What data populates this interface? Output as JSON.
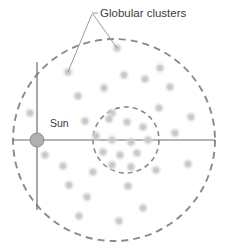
{
  "figure": {
    "type": "astronomy-diagram",
    "background_color": "#ffffff"
  },
  "labels": {
    "globular_clusters": "Globular clusters",
    "sun": "Sun"
  },
  "colors": {
    "dashed_circle": "#8a8a8a",
    "axis_line": "#6e6e6e",
    "leader_line": "#9a9a9a",
    "sun_fill": "#b0b0b0",
    "sun_stroke": "#8a8a8a",
    "cluster_dot": "#c9c9c9",
    "text": "#3a3a3a"
  },
  "halo_circle": {
    "name": "outer-halo-boundary",
    "cx": 114,
    "cy": 140,
    "r": 101,
    "style": "dashed",
    "dash": "7,5",
    "stroke_width": 1.9
  },
  "inner_circle": {
    "name": "galactic-center-region",
    "cx": 126,
    "cy": 140,
    "r": 33,
    "style": "dashed",
    "dash": "5,4",
    "stroke_width": 1.6
  },
  "sun_marker": {
    "cx": 37,
    "cy": 140,
    "r": 7,
    "label_x": 50,
    "label_y": 127
  },
  "axes": {
    "horizontal": {
      "x1": 13,
      "y1": 140,
      "x2": 215,
      "y2": 140
    },
    "vertical": {
      "x1": 37,
      "y1": 62,
      "x2": 37,
      "y2": 210
    }
  },
  "title_label": {
    "text_x": 100,
    "text_y": 17,
    "anchor_x": 92,
    "anchor_y": 13,
    "tick_x1": 92,
    "tick_y1": 13,
    "tick_x2": 98,
    "tick_y2": 13,
    "leaders": [
      {
        "x1": 92,
        "y1": 14,
        "x2": 68,
        "y2": 72
      },
      {
        "x1": 93,
        "y1": 14,
        "x2": 117,
        "y2": 48
      }
    ]
  },
  "chart_data": {
    "type": "scatter",
    "title": "Globular clusters",
    "xlabel": "",
    "ylabel": "",
    "grid": false,
    "legend": "none",
    "annotations": [
      "Globular clusters",
      "Sun"
    ],
    "series": [
      {
        "name": "globular-clusters-halo",
        "points": [
          [
            68,
            72
          ],
          [
            117,
            48
          ],
          [
            78,
            96
          ],
          [
            104,
            88
          ],
          [
            124,
            75
          ],
          [
            145,
            79
          ],
          [
            170,
            87
          ],
          [
            159,
            108
          ],
          [
            30,
            113
          ],
          [
            63,
            166
          ],
          [
            85,
            121
          ],
          [
            112,
            113
          ],
          [
            160,
            68
          ],
          [
            191,
            117
          ],
          [
            69,
            185
          ],
          [
            93,
            172
          ],
          [
            87,
            197
          ],
          [
            128,
            186
          ],
          [
            156,
            170
          ],
          [
            188,
            164
          ],
          [
            79,
            216
          ],
          [
            119,
            221
          ],
          [
            143,
            208
          ],
          [
            45,
            155
          ],
          [
            175,
            133
          ]
        ]
      },
      {
        "name": "globular-clusters-core",
        "points": [
          [
            109,
            119
          ],
          [
            127,
            122
          ],
          [
            143,
            127
          ],
          [
            96,
            136
          ],
          [
            112,
            140
          ],
          [
            131,
            142
          ],
          [
            148,
            140
          ],
          [
            103,
            152
          ],
          [
            120,
            155
          ],
          [
            137,
            153
          ],
          [
            112,
            165
          ],
          [
            131,
            167
          ]
        ]
      }
    ]
  }
}
